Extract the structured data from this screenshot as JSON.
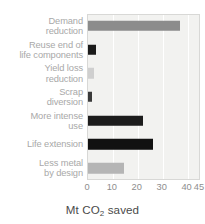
{
  "chart_data": {
    "type": "bar",
    "orientation": "horizontal",
    "title": "",
    "subtitle": "",
    "xlabel": "Mt CO2 saved",
    "xlabel_prefix": "Mt CO",
    "xlabel_sub": "2",
    "xlabel_suffix": " saved",
    "ylabel": "",
    "categories": [
      "Demand\nreduction",
      "Reuse end of\nlife components",
      "Yield loss\nreduction",
      "Scrap\ndiversion",
      "More intense\nuse",
      "Life extension",
      "Less metal\nby design"
    ],
    "values": [
      37.0,
      3.2,
      2.5,
      1.7,
      22.0,
      26.0,
      14.5
    ],
    "bar_colors": [
      "#8c8c8c",
      "#1a1a1a",
      "#cfcfcf",
      "#3a3a3a",
      "#1c1c1c",
      "#111111",
      "#b5b5b5"
    ],
    "xlim": [
      0,
      45
    ],
    "xticks": [
      0,
      10,
      20,
      30,
      40,
      45
    ],
    "xtick_labels": [
      "0",
      "10",
      "20",
      "30",
      "40",
      "45"
    ],
    "grid": true,
    "grid_color": "#ffffff",
    "plot_background": "#f2f2f0",
    "legend": null,
    "legend_position": "none"
  }
}
